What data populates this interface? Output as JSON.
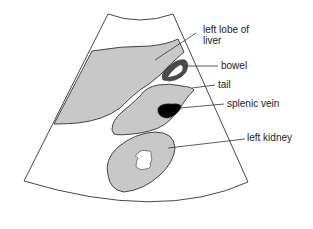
{
  "diagram": {
    "type": "ultrasound-schematic",
    "colors": {
      "background": "#ffffff",
      "outline": "#333333",
      "tissue_fill": "#c8c8c8",
      "bowel_wall": "#4a4a4a",
      "splenic_vein": "#000000",
      "label_text": "#222222"
    },
    "labels": [
      {
        "id": "left-lobe-liver",
        "lines": [
          "left lobe of",
          "liver"
        ]
      },
      {
        "id": "bowel",
        "lines": [
          "bowel"
        ]
      },
      {
        "id": "tail",
        "lines": [
          "tail"
        ]
      },
      {
        "id": "splenic-vein",
        "lines": [
          "splenic vein"
        ]
      },
      {
        "id": "left-kidney",
        "lines": [
          "left kidney"
        ]
      }
    ]
  }
}
